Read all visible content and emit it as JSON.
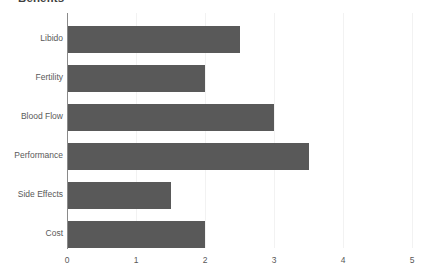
{
  "chart_data": {
    "type": "bar",
    "orientation": "horizontal",
    "title": "Benefits",
    "xlabel": "",
    "ylabel": "",
    "categories": [
      "Libido",
      "Fertility",
      "Blood Flow",
      "Performance",
      "Side Effects",
      "Cost"
    ],
    "values": [
      2.5,
      2.0,
      3.0,
      3.5,
      1.5,
      2.0
    ],
    "xlim": [
      0,
      5
    ],
    "xticks": [
      "0",
      "1",
      "2",
      "3",
      "4",
      "5"
    ],
    "xtick_values": [
      0,
      1,
      2,
      3,
      4,
      5
    ],
    "grid": true,
    "grid_axis": "x",
    "legend": false,
    "bar_color": "#595959",
    "gridline_color": "#f2f2f2",
    "axis_color": "#8a8a8a",
    "background_color": "#ffffff",
    "text_color": "#595959"
  }
}
